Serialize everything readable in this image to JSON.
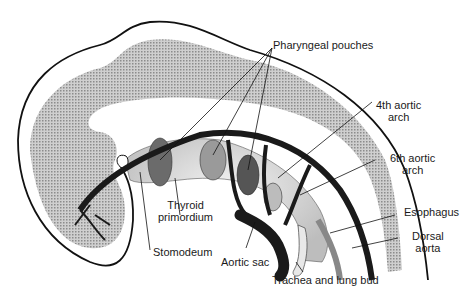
{
  "figure": {
    "labels": {
      "pharyngeal_pouches": "Pharyngeal pouches",
      "fourth_aortic_arch_l1": "4th aortic",
      "fourth_aortic_arch_l2": "arch",
      "sixth_aortic_arch_l1": "6th aortic",
      "sixth_aortic_arch_l2": "arch",
      "esophagus": "Esophagus",
      "dorsal_aorta_l1": "Dorsal",
      "dorsal_aorta_l2": "aorta",
      "thyroid_primordium_l1": "Thyroid",
      "thyroid_primordium_l2": "primordium",
      "stomodeum": "Stomodeum",
      "aortic_sac": "Aortic sac",
      "trachea_lung_bud": "Trachea and lung bud"
    },
    "colors": {
      "outline": "#111111",
      "mesoderm_stipple": "#bdbdbd",
      "vessel": "#1a1a1a",
      "pouch_dark": "#5a5a5a",
      "pouch_mid": "#8a8a8a",
      "endoderm": "#d8d8d8"
    }
  }
}
